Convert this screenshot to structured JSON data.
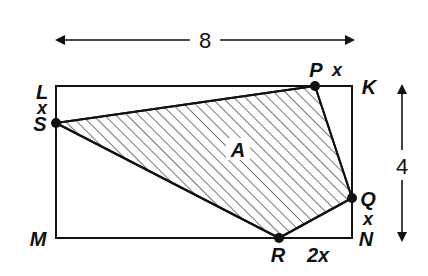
{
  "figure": {
    "dimension_width": "8",
    "dimension_height": "4",
    "region_label": "A",
    "colors": {
      "ink": "#111111",
      "hatch": "#555555",
      "background": "#ffffff"
    },
    "rectangle_corners": {
      "L": "L",
      "K": "K",
      "M": "M",
      "N": "N"
    },
    "points": {
      "P": "P",
      "Q": "Q",
      "R": "R",
      "S": "S"
    },
    "segment_labels": {
      "PK": "x",
      "LS": "x",
      "QN": "x",
      "RN": "2x"
    }
  }
}
